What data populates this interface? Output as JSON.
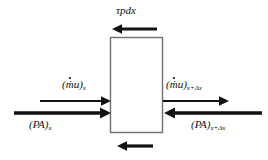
{
  "figure": {
    "background_color": "#ffffff",
    "line_color": "#111111",
    "box_fill": "#ffffff",
    "box_stroke": "#6f6f6f"
  },
  "control_volume": {
    "name": "control volume box",
    "x": 110,
    "y": 37,
    "width": 53,
    "height": 96
  },
  "labels": {
    "shear_top": {
      "text": "τpdx",
      "tau": "τ",
      "body": "pdx"
    },
    "momentum_in": {
      "open_paren": "(",
      "mdot": "ṁ",
      "velocity": "u",
      "close_paren": ")",
      "subscript": "x"
    },
    "momentum_out": {
      "open_paren": "(",
      "mdot": "ṁ",
      "velocity": "u",
      "close_paren": ")",
      "subscript": "x+Δx"
    },
    "pressure_in": {
      "open_paren": "(",
      "body": "PA",
      "close_paren": ")",
      "subscript": "x"
    },
    "pressure_out": {
      "open_paren": "(",
      "body": "PA",
      "close_paren": ")",
      "subscript": "x+Δx"
    }
  },
  "arrows": {
    "shear_top": {
      "name": "shear-stress-top-arrow",
      "direction": "left",
      "x_start": 157,
      "x_end": 113,
      "y": 29,
      "thickness": 3
    },
    "shear_bottom": {
      "name": "shear-stress-bottom-arrow",
      "direction": "left",
      "x_start": 153,
      "x_end": 118,
      "y": 146,
      "thickness": 3
    },
    "momentum_in": {
      "name": "momentum-inflow-arrow",
      "direction": "right",
      "x_start": 40,
      "x_end": 110,
      "y": 101,
      "thickness": 2
    },
    "momentum_out": {
      "name": "momentum-outflow-arrow",
      "direction": "right",
      "x_start": 163,
      "x_end": 228,
      "y": 101,
      "thickness": 2
    },
    "pressure_in": {
      "name": "pressure-inflow-arrow",
      "direction": "right",
      "x_start": 14,
      "x_end": 110,
      "y": 113,
      "thickness": 3
    },
    "pressure_out": {
      "name": "pressure-outflow-arrow",
      "direction": "left",
      "x_start": 262,
      "x_end": 163,
      "y": 113,
      "thickness": 3
    }
  }
}
